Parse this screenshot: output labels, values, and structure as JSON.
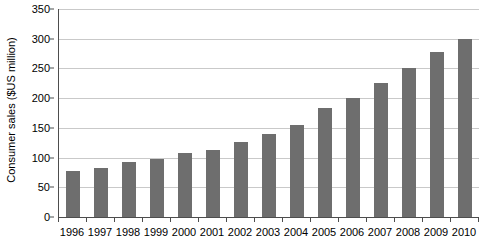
{
  "chart_data": {
    "type": "bar",
    "title": "",
    "subtitle": "",
    "xlabel": "",
    "ylabel": "Consumer sales ($US million)",
    "categories": [
      "1996",
      "1997",
      "1998",
      "1999",
      "2000",
      "2001",
      "2002",
      "2003",
      "2004",
      "2005",
      "2006",
      "2007",
      "2008",
      "2009",
      "2010"
    ],
    "values": [
      78,
      83,
      92,
      98,
      107,
      113,
      127,
      140,
      155,
      183,
      200,
      225,
      250,
      278,
      299
    ],
    "ylim": [
      0,
      350
    ],
    "yticks": [
      0,
      50,
      100,
      150,
      200,
      250,
      300,
      350
    ],
    "ytick_labels": [
      "0",
      "50",
      "100",
      "150",
      "200",
      "250",
      "300",
      "350"
    ],
    "grid": true,
    "grid_axis": "y",
    "legend": false,
    "legend_position": "none",
    "series": [
      {
        "name": "Consumer sales",
        "color": "#6e6e6e",
        "values": [
          78,
          83,
          92,
          98,
          107,
          113,
          127,
          140,
          155,
          183,
          200,
          225,
          250,
          278,
          299
        ]
      }
    ],
    "colors": {
      "bar_fill": "#6e6e6e",
      "gridline": "#c9c9c9",
      "axis": "#4d4d4d",
      "text": "#000000",
      "background": "#ffffff"
    }
  }
}
